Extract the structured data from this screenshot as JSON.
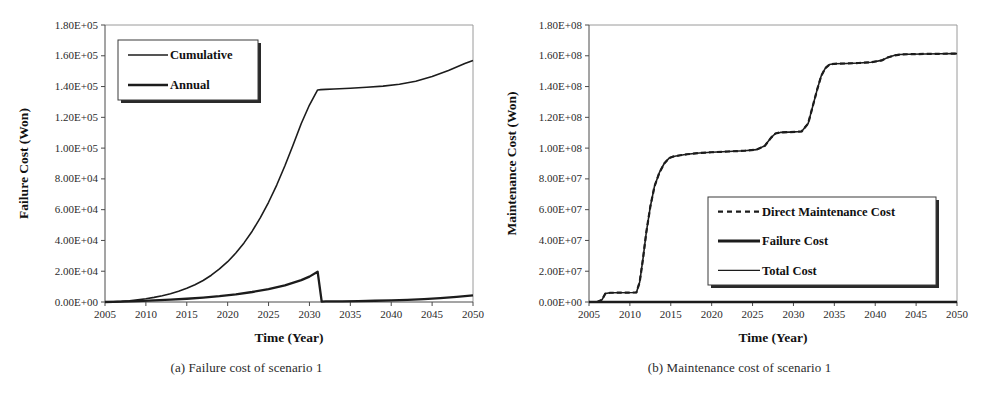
{
  "figure": {
    "panels": [
      {
        "caption": "(a) Failure cost of scenario 1",
        "chart_data": {
          "type": "line",
          "title": "",
          "xlabel": "Time (Year)",
          "ylabel": "Failure Cost (Won)",
          "xlim": [
            2005,
            2050
          ],
          "ylim": [
            0,
            180000
          ],
          "xticks": [
            2005,
            2010,
            2015,
            2020,
            2025,
            2030,
            2035,
            2040,
            2045,
            2050
          ],
          "xtick_labels": [
            "2005",
            "2010",
            "2015",
            "2020",
            "2025",
            "2030",
            "2035",
            "2040",
            "2045",
            "2050"
          ],
          "yticks": [
            0,
            20000,
            40000,
            60000,
            80000,
            100000,
            120000,
            140000,
            160000,
            180000
          ],
          "ytick_labels": [
            "0.00E+00",
            "2.00E+04",
            "4.00E+04",
            "6.00E+04",
            "8.00E+04",
            "1.00E+05",
            "1.20E+05",
            "1.40E+05",
            "1.60E+05",
            "1.80E+05"
          ],
          "grid": false,
          "legend_position": "upper-left",
          "series": [
            {
              "name": "Cumulative",
              "style": "solid",
              "width": 1.6,
              "x": [
                2005,
                2006,
                2007,
                2008,
                2009,
                2010,
                2011,
                2012,
                2013,
                2014,
                2015,
                2016,
                2017,
                2018,
                2019,
                2020,
                2021,
                2022,
                2023,
                2024,
                2025,
                2026,
                2027,
                2028,
                2029,
                2030,
                2031,
                2031.4,
                2032,
                2033,
                2035,
                2037,
                2039,
                2041,
                2043,
                2045,
                2047,
                2049,
                2050
              ],
              "values": [
                0,
                150,
                400,
                800,
                1400,
                2100,
                3000,
                4100,
                5400,
                7000,
                8900,
                11200,
                14000,
                17400,
                21500,
                26200,
                31800,
                38400,
                46000,
                54800,
                64800,
                76000,
                88500,
                102000,
                116000,
                128000,
                137800,
                138000,
                138200,
                138400,
                138900,
                139500,
                140300,
                141500,
                143500,
                146500,
                150500,
                155000,
                157000
              ]
            },
            {
              "name": "Annual",
              "style": "solid",
              "width": 2.3,
              "x": [
                2005,
                2007,
                2009,
                2011,
                2013,
                2015,
                2017,
                2019,
                2021,
                2023,
                2025,
                2027,
                2029,
                2030,
                2031,
                2031.5,
                2032,
                2034,
                2036,
                2038,
                2040,
                2042,
                2044,
                2046,
                2048,
                2050
              ],
              "values": [
                0,
                250,
                600,
                1000,
                1500,
                2100,
                2900,
                3800,
                5000,
                6500,
                8400,
                10800,
                14200,
                16500,
                19700,
                300,
                350,
                450,
                600,
                800,
                1050,
                1400,
                1900,
                2500,
                3300,
                4300
              ]
            }
          ]
        },
        "legend": [
          {
            "label": "Cumulative",
            "style": "solid",
            "width": 1.6
          },
          {
            "label": "Annual",
            "style": "solid",
            "width": 2.4
          }
        ]
      },
      {
        "caption": "(b) Maintenance cost of scenario 1",
        "chart_data": {
          "type": "line",
          "title": "",
          "xlabel": "Time (Year)",
          "ylabel": "Maintenance Cost (Won)",
          "xlim": [
            2005,
            2050
          ],
          "ylim": [
            0,
            180000000
          ],
          "xticks": [
            2005,
            2010,
            2015,
            2020,
            2025,
            2030,
            2035,
            2040,
            2045,
            2050
          ],
          "xtick_labels": [
            "2005",
            "2010",
            "2015",
            "2020",
            "2025",
            "2030",
            "2035",
            "2040",
            "2045",
            "2050"
          ],
          "yticks": [
            0,
            20000000,
            40000000,
            60000000,
            80000000,
            100000000,
            120000000,
            140000000,
            160000000,
            180000000
          ],
          "ytick_labels": [
            "0.00E+00",
            "2.00E+07",
            "4.00E+07",
            "6.00E+07",
            "8.00E+07",
            "1.00E+08",
            "1.20E+08",
            "1.40E+08",
            "1.60E+08",
            "1.80E+08"
          ],
          "grid": false,
          "legend_position": "lower-right",
          "series": [
            {
              "name": "Total Cost",
              "style": "solid",
              "width": 1.6,
              "x": [
                2005,
                2006,
                2006.6,
                2007,
                2007.6,
                2010.8,
                2011.2,
                2011.6,
                2012,
                2012.5,
                2013,
                2013.6,
                2014.2,
                2014.8,
                2015.3,
                2016,
                2017,
                2018.5,
                2020,
                2022,
                2024,
                2025.5,
                2026.5,
                2027.3,
                2027.8,
                2028.4,
                2029.5,
                2031,
                2031.8,
                2032.3,
                2032.9,
                2033.4,
                2033.9,
                2034.4,
                2035,
                2036.5,
                2038,
                2039.5,
                2040.8,
                2041.6,
                2042.4,
                2043,
                2044,
                2046,
                2048,
                2050
              ],
              "values": [
                0,
                0,
                1500000,
                5500000,
                6000000,
                6200000,
                13000000,
                28000000,
                45000000,
                62000000,
                75000000,
                84000000,
                90000000,
                93500000,
                94500000,
                95200000,
                96000000,
                96800000,
                97300000,
                97800000,
                98300000,
                99000000,
                101500000,
                107000000,
                109500000,
                110200000,
                110400000,
                110800000,
                116000000,
                126000000,
                138000000,
                147000000,
                152000000,
                154300000,
                154800000,
                155000000,
                155300000,
                155800000,
                157000000,
                159000000,
                160300000,
                160800000,
                161000000,
                161200000,
                161300000,
                161400000
              ]
            },
            {
              "name": "Direct Maintenance Cost",
              "style": "dashed",
              "width": 2.2,
              "x": [
                2005,
                2006,
                2006.6,
                2007,
                2007.6,
                2010.8,
                2011.2,
                2011.6,
                2012,
                2012.5,
                2013,
                2013.6,
                2014.2,
                2014.8,
                2015.3,
                2016,
                2017,
                2018.5,
                2020,
                2022,
                2024,
                2025.5,
                2026.5,
                2027.3,
                2027.8,
                2028.4,
                2029.5,
                2031,
                2031.8,
                2032.3,
                2032.9,
                2033.4,
                2033.9,
                2034.4,
                2035,
                2036.5,
                2038,
                2039.5,
                2040.8,
                2041.6,
                2042.4,
                2043,
                2044,
                2046,
                2048,
                2050
              ],
              "values": [
                0,
                0,
                1500000,
                5500000,
                6000000,
                6200000,
                13000000,
                28000000,
                45000000,
                62000000,
                75000000,
                84000000,
                90000000,
                93500000,
                94500000,
                95200000,
                96000000,
                96800000,
                97300000,
                97800000,
                98300000,
                99000000,
                101500000,
                107000000,
                109500000,
                110200000,
                110400000,
                110800000,
                116000000,
                126000000,
                138000000,
                147000000,
                152000000,
                154300000,
                154800000,
                155000000,
                155300000,
                155800000,
                157000000,
                159000000,
                160300000,
                160800000,
                161000000,
                161200000,
                161300000,
                161400000
              ]
            },
            {
              "name": "Failure Cost",
              "style": "solid",
              "width": 2.4,
              "x": [
                2005,
                2010,
                2015,
                2020,
                2025,
                2030,
                2035,
                2040,
                2045,
                2050
              ],
              "values": [
                0,
                0,
                0,
                0,
                0,
                0,
                0,
                0,
                0,
                0
              ]
            }
          ]
        },
        "legend": [
          {
            "label": "Direct Maintenance Cost",
            "style": "dashed",
            "width": 2.4
          },
          {
            "label": "Failure Cost",
            "style": "solid",
            "width": 2.8
          },
          {
            "label": "Total Cost",
            "style": "solid",
            "width": 1.3
          }
        ]
      }
    ]
  },
  "colors": {
    "ink": "#1c1c1c",
    "axis": "#4a4a4a",
    "frame": "#9a9a9a",
    "background": "#ffffff"
  }
}
